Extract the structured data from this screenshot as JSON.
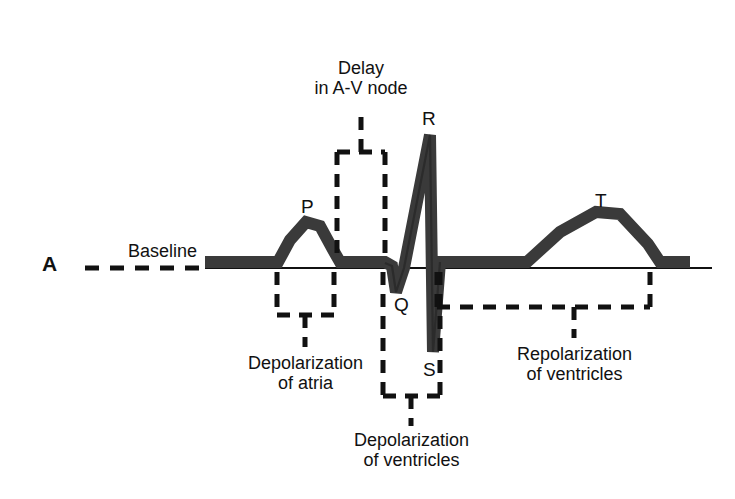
{
  "figure": {
    "panel_label": "A",
    "baseline_label": "Baseline"
  },
  "wave_labels": {
    "p": "P",
    "q": "Q",
    "r": "R",
    "s": "S",
    "t": "T"
  },
  "annotations": {
    "av_delay": "Delay\nin A-V node",
    "atrial_depolarization": "Depolarization\nof atria",
    "ventricular_depolarization": "Depolarization\nof ventricles",
    "ventricular_repolarization": "Repolarization\nof ventricles"
  },
  "colors": {
    "trace": "#3a3a3a",
    "ink": "#111111",
    "background": "#ffffff"
  },
  "chart_data": {
    "type": "line",
    "xlabel": "",
    "ylabel": "",
    "baseline_y": 268,
    "trace_band_thickness": 12,
    "grid": false,
    "legend": null,
    "waves": [
      {
        "name": "P",
        "label_x": 307,
        "label_y": 198,
        "peak_x": 313,
        "peak_y": 222,
        "description": "atrial depolarization hump, rounded, above baseline"
      },
      {
        "name": "Q",
        "label_x": 399,
        "label_y": 302,
        "trough_x": 396,
        "trough_y": 292,
        "description": "small negative deflection below baseline"
      },
      {
        "name": "R",
        "label_x": 428,
        "label_y": 112,
        "peak_x": 430,
        "peak_y": 135,
        "description": "tall sharp positive spike"
      },
      {
        "name": "S",
        "label_x": 428,
        "label_y": 365,
        "trough_x": 433,
        "trough_y": 352,
        "description": "deep sharp negative spike"
      },
      {
        "name": "T",
        "label_x": 600,
        "label_y": 196,
        "peak_x": 604,
        "peak_y": 212,
        "description": "broad rounded repolarization hump"
      }
    ],
    "polyline_points": [
      {
        "x": 205,
        "y": 262
      },
      {
        "x": 278,
        "y": 262
      },
      {
        "x": 290,
        "y": 240
      },
      {
        "x": 306,
        "y": 222
      },
      {
        "x": 320,
        "y": 226
      },
      {
        "x": 332,
        "y": 248
      },
      {
        "x": 340,
        "y": 262
      },
      {
        "x": 385,
        "y": 262
      },
      {
        "x": 392,
        "y": 266
      },
      {
        "x": 396,
        "y": 292
      },
      {
        "x": 404,
        "y": 268
      },
      {
        "x": 430,
        "y": 135
      },
      {
        "x": 433,
        "y": 352
      },
      {
        "x": 440,
        "y": 262
      },
      {
        "x": 527,
        "y": 262
      },
      {
        "x": 560,
        "y": 232
      },
      {
        "x": 596,
        "y": 212
      },
      {
        "x": 620,
        "y": 214
      },
      {
        "x": 648,
        "y": 244
      },
      {
        "x": 660,
        "y": 262
      },
      {
        "x": 690,
        "y": 262
      }
    ],
    "brackets": [
      {
        "name": "av-delay",
        "x1": 337,
        "x2": 385,
        "y": 152,
        "orientation": "up",
        "stem_x": 361,
        "stem_y": 120,
        "label": "Delay in A-V node"
      },
      {
        "name": "atrial-depolarization",
        "x1": 277,
        "x2": 334,
        "y": 315,
        "orientation": "down",
        "stem_x": 305,
        "stem_y": 338,
        "label": "Depolarization of atria"
      },
      {
        "name": "ventricular-depolarization",
        "x1": 383,
        "x2": 440,
        "y": 396,
        "orientation": "down",
        "stem_x": 411,
        "stem_y": 418,
        "label": "Depolarization of ventricles"
      },
      {
        "name": "ventricular-repolarization",
        "x1": 437,
        "x2": 650,
        "y": 307,
        "orientation": "down",
        "stem_x": 574,
        "stem_y": 330,
        "label": "Repolarization of ventricles"
      }
    ],
    "baseline_dashed_segment": {
      "x1": 85,
      "x2": 205,
      "y": 268
    },
    "baseline_solid_segment": {
      "x1": 205,
      "x2": 712,
      "y": 268
    }
  }
}
